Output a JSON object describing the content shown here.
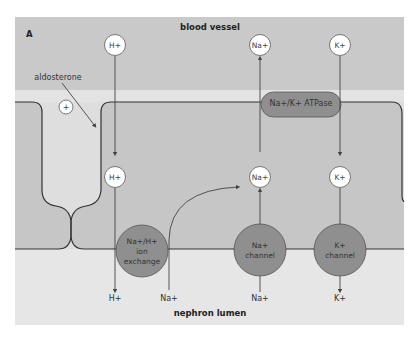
{
  "panel_letter": "A",
  "regions": {
    "blood_vessel": "blood vessel",
    "nephron_lumen": "nephron lumen"
  },
  "hormone": {
    "label": "aldosterone",
    "effect_symbol": "+"
  },
  "ions_blood": [
    {
      "label": "H+",
      "direction": "into cell"
    },
    {
      "label": "Na+",
      "direction": "out to blood"
    },
    {
      "label": "K+",
      "direction": "into cell"
    }
  ],
  "ions_cell": [
    "H+",
    "Na+",
    "K+"
  ],
  "ions_lumen": [
    "H+",
    "Na+",
    "Na+",
    "K+"
  ],
  "transporters": {
    "atpase": "Na+/K+ ATPase",
    "exchanger": {
      "line1": "Na+/H+",
      "line2": "ion",
      "line3": "exchange"
    },
    "na_channel": {
      "line1": "Na+",
      "line2": "channel"
    },
    "k_channel": {
      "line1": "K+",
      "line2": "channel"
    }
  },
  "colors": {
    "blood": "#c9c9c9",
    "strip": "#e3e3e3",
    "cell": "#c6c6c6",
    "junction": "#dedede",
    "lumen": "#e6e6e6",
    "protein": "#8f8f8f",
    "line": "#333333"
  }
}
